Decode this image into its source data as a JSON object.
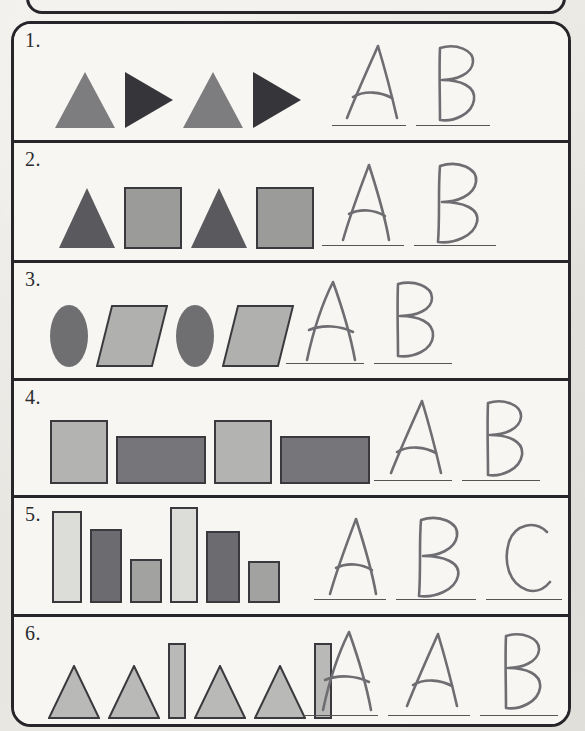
{
  "worksheet": {
    "type": "pattern-recognition-worksheet",
    "medium": "printed paper with handwritten pencil answers",
    "colors": {
      "paper": "#f6f5f1",
      "ink": "#26262a",
      "pencil": "#6d6d72",
      "shape_dark": "#4a4a4d",
      "shape_mid": "#7d7d80",
      "shape_light": "#b7b7b5",
      "shape_pale": "#dcdcd8"
    },
    "problems": [
      {
        "number": "1.",
        "shapes": [
          {
            "kind": "triangle-up",
            "fill": "#7d7d80",
            "stroke": "none",
            "w": 62,
            "h": 58
          },
          {
            "kind": "triangle-right",
            "fill": "#36363a",
            "stroke": "none",
            "w": 50,
            "h": 58
          },
          {
            "kind": "triangle-up",
            "fill": "#7d7d80",
            "stroke": "none",
            "w": 62,
            "h": 58
          },
          {
            "kind": "triangle-right",
            "fill": "#36363a",
            "stroke": "none",
            "w": 50,
            "h": 58
          }
        ],
        "answers": [
          {
            "letter": "A",
            "line_width": 74
          },
          {
            "letter": "B",
            "line_width": 74
          }
        ]
      },
      {
        "number": "2.",
        "shapes": [
          {
            "kind": "triangle-up",
            "fill": "#5a5a5e",
            "stroke": "none",
            "w": 58,
            "h": 62
          },
          {
            "kind": "rect",
            "fill": "#9b9b9a",
            "stroke": "#3a3a3e",
            "w": 58,
            "h": 62
          },
          {
            "kind": "triangle-up",
            "fill": "#5a5a5e",
            "stroke": "none",
            "w": 58,
            "h": 62
          },
          {
            "kind": "rect",
            "fill": "#9b9b9a",
            "stroke": "#3a3a3e",
            "w": 58,
            "h": 62
          }
        ],
        "answers": [
          {
            "letter": "A",
            "line_width": 82
          },
          {
            "letter": "B",
            "line_width": 82
          }
        ]
      },
      {
        "number": "3.",
        "shapes": [
          {
            "kind": "ellipse",
            "fill": "#6f6f72",
            "stroke": "none",
            "w": 38,
            "h": 62
          },
          {
            "kind": "parallelogram",
            "fill": "#b0b0ae",
            "stroke": "#3a3a3e",
            "w": 72,
            "h": 62
          },
          {
            "kind": "ellipse",
            "fill": "#6f6f72",
            "stroke": "none",
            "w": 38,
            "h": 62
          },
          {
            "kind": "parallelogram",
            "fill": "#b0b0ae",
            "stroke": "#3a3a3e",
            "w": 72,
            "h": 62
          }
        ],
        "answers": [
          {
            "letter": "A",
            "line_width": 78
          },
          {
            "letter": "B",
            "line_width": 78
          }
        ]
      },
      {
        "number": "4.",
        "shapes": [
          {
            "kind": "rect",
            "fill": "#b3b3b1",
            "stroke": "#3a3a3e",
            "w": 58,
            "h": 64
          },
          {
            "kind": "rect",
            "fill": "#75757a",
            "stroke": "#3a3a3e",
            "w": 90,
            "h": 48
          },
          {
            "kind": "rect",
            "fill": "#b3b3b1",
            "stroke": "#3a3a3e",
            "w": 58,
            "h": 64
          },
          {
            "kind": "rect",
            "fill": "#75757a",
            "stroke": "#3a3a3e",
            "w": 90,
            "h": 48
          }
        ],
        "answers": [
          {
            "letter": "A",
            "line_width": 78
          },
          {
            "letter": "B",
            "line_width": 78
          }
        ]
      },
      {
        "number": "5.",
        "shapes": [
          {
            "kind": "rect",
            "fill": "#dcdcd8",
            "stroke": "#3a3a3e",
            "w": 30,
            "h": 92
          },
          {
            "kind": "rect",
            "fill": "#6c6c70",
            "stroke": "#3a3a3e",
            "w": 32,
            "h": 74
          },
          {
            "kind": "rect",
            "fill": "#a2a2a1",
            "stroke": "#3a3a3e",
            "w": 32,
            "h": 44
          },
          {
            "kind": "rect",
            "fill": "#dcdcd8",
            "stroke": "#3a3a3e",
            "w": 28,
            "h": 96
          },
          {
            "kind": "rect",
            "fill": "#6c6c70",
            "stroke": "#3a3a3e",
            "w": 34,
            "h": 72
          },
          {
            "kind": "rect",
            "fill": "#a2a2a1",
            "stroke": "#3a3a3e",
            "w": 32,
            "h": 42
          }
        ],
        "answers": [
          {
            "letter": "A",
            "line_width": 72
          },
          {
            "letter": "B",
            "line_width": 80
          },
          {
            "letter": "C",
            "line_width": 76
          }
        ]
      },
      {
        "number": "6.",
        "shapes": [
          {
            "kind": "triangle-up",
            "fill": "#b9b9b7",
            "stroke": "#3a3a3e",
            "w": 52,
            "h": 54
          },
          {
            "kind": "triangle-up",
            "fill": "#b9b9b7",
            "stroke": "#3a3a3e",
            "w": 52,
            "h": 54
          },
          {
            "kind": "rect",
            "fill": "#b9b9b7",
            "stroke": "#3a3a3e",
            "w": 18,
            "h": 76
          },
          {
            "kind": "triangle-up",
            "fill": "#b9b9b7",
            "stroke": "#3a3a3e",
            "w": 52,
            "h": 54
          },
          {
            "kind": "triangle-up",
            "fill": "#b9b9b7",
            "stroke": "#3a3a3e",
            "w": 52,
            "h": 54
          },
          {
            "kind": "rect",
            "fill": "#b9b9b7",
            "stroke": "#3a3a3e",
            "w": 18,
            "h": 76
          }
        ],
        "answers": [
          {
            "letter": "A",
            "line_width": 74
          },
          {
            "letter": "A",
            "line_width": 82
          },
          {
            "letter": "B",
            "line_width": 78
          }
        ]
      }
    ]
  }
}
